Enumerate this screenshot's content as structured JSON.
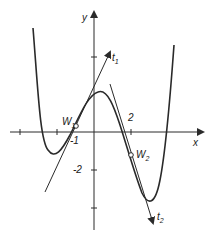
{
  "diagram": {
    "type": "function-graph-with-tangents",
    "axes": {
      "x_label": "x",
      "y_label": "y",
      "x_tick_label": "2",
      "x_point_label": "-1",
      "y_tick_label": "-2"
    },
    "points": [
      {
        "name": "W",
        "sub": "1",
        "x": -1,
        "y": 0.3
      },
      {
        "name": "W",
        "sub": "2",
        "x": 2,
        "y": -1.2
      }
    ],
    "tangents": [
      {
        "name": "t",
        "sub": "1"
      },
      {
        "name": "t",
        "sub": "2"
      }
    ],
    "colors": {
      "stroke": "#2a2a2a",
      "background": "#ffffff"
    }
  }
}
